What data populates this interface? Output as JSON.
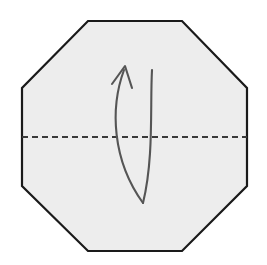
{
  "figure": {
    "title": "Octagon valley fold diagram",
    "caption": "Fold the octagon in half along the horizontal crease line.",
    "width": 267,
    "height": 265,
    "background_color": "#ffffff"
  },
  "colors": {
    "paper_fill": "#ededed",
    "paper_stroke": "#1a1a1a",
    "fold_line": "#3a3a3a",
    "arrow_stroke": "#555555",
    "canvas": "#ffffff"
  },
  "shape": {
    "name": "octagon",
    "label": "paper-sheet",
    "fill": "#ededed",
    "stroke": "#1a1a1a",
    "stroke_width": 2.2,
    "points": "88,21 182,21 247,88 247,186 182,251 88,251 22,186 22,88",
    "vertices": [
      {
        "x": 88,
        "y": 21
      },
      {
        "x": 182,
        "y": 21
      },
      {
        "x": 247,
        "y": 88
      },
      {
        "x": 247,
        "y": 186
      },
      {
        "x": 182,
        "y": 251
      },
      {
        "x": 88,
        "y": 251
      },
      {
        "x": 22,
        "y": 186
      },
      {
        "x": 22,
        "y": 88
      }
    ]
  },
  "fold_line": {
    "name": "valley-fold-crease",
    "style": "dashed",
    "orientation": "horizontal",
    "x1": 22,
    "y1": 137,
    "x2": 247,
    "y2": 137,
    "stroke": "#3a3a3a",
    "stroke_width": 2.2,
    "dash_pattern": "6 4"
  },
  "arrow": {
    "name": "fold-direction-arrow",
    "kind": "curved-valley-fold-arrow",
    "stroke": "#555555",
    "stroke_width": 2.1,
    "shaft_left_path": "M 143 203 C 112 160 110 108 124 70",
    "shaft_right_path": "M 143 203 C 154 158 150 106 152 70",
    "head_path": "M 112 84 L 125 66 L 132 88",
    "tip": {
      "x": 125,
      "y": 66
    },
    "tail": {
      "x": 143,
      "y": 203
    }
  }
}
